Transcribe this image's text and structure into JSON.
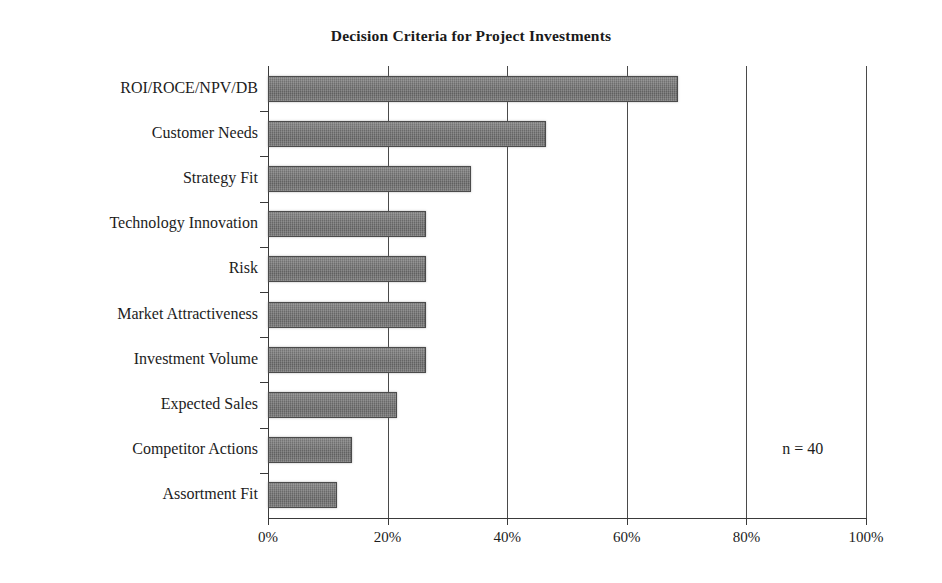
{
  "chart_data": {
    "type": "bar",
    "orientation": "horizontal",
    "title": "Decision Criteria for Project Investments",
    "xlabel": "",
    "ylabel": "",
    "categories": [
      "ROI/ROCE/NPV/DB",
      "Customer Needs",
      "Strategy Fit",
      "Technology Innovation",
      "Risk",
      "Market Attractiveness",
      "Investment Volume",
      "Expected Sales",
      "Competitor Actions",
      "Assortment Fit"
    ],
    "values": [
      68.5,
      46.5,
      34,
      26.5,
      26.5,
      26.5,
      26.5,
      21.5,
      14,
      11.5
    ],
    "value_unit": "%",
    "xlim": [
      0,
      100
    ],
    "xticks": [
      0,
      20,
      40,
      60,
      80,
      100
    ],
    "xtick_labels": [
      "0%",
      "20%",
      "40%",
      "60%",
      "80%",
      "100%"
    ],
    "grid": "vertical",
    "legend": "none",
    "annotation": "n = 40",
    "bar_color": "#6a6a6a",
    "bar_edge_color": "#4b4b4b",
    "axis_color": "#3a3a3a",
    "background_color": "#ffffff",
    "text_color": "#1c1c1c"
  }
}
